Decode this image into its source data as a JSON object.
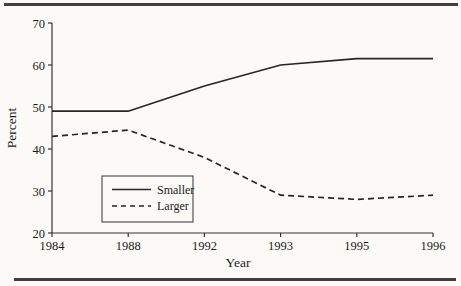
{
  "figure": {
    "background": "#fbfaf7",
    "rule_color": "#3f3f3f"
  },
  "chart_data": {
    "type": "line",
    "categories": [
      "1984",
      "1988",
      "1992",
      "1993",
      "1995",
      "1996"
    ],
    "series": [
      {
        "name": "Smaller",
        "style": "solid",
        "values": [
          49,
          49,
          55,
          60,
          61.5,
          61.5
        ]
      },
      {
        "name": "Larger",
        "style": "dashed",
        "values": [
          43,
          44.5,
          38,
          29,
          28,
          29
        ]
      }
    ],
    "title": "",
    "xlabel": "Year",
    "ylabel": "Percent",
    "ylim": [
      20,
      70
    ],
    "yticks": [
      20,
      30,
      40,
      50,
      60,
      70
    ],
    "grid": false,
    "legend_position": "inside-bottom-left",
    "legend_labels": [
      "Smaller",
      "Larger"
    ],
    "line_color": "#262626",
    "axis_color": "#333333",
    "text_color": "#1c1c1c"
  }
}
